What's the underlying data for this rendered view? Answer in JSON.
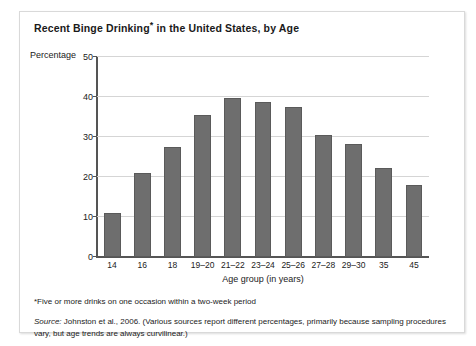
{
  "figure": {
    "title_text": "Recent Binge Drinking",
    "title_asterisk": "*",
    "title_rest": " in the United States, by Age",
    "axis_unit_label": "Percentage",
    "footnote": "*Five or more drinks on one occasion within a two-week period",
    "source_label": "Source:",
    "source_text": " Johnston et al., 2006. (Various sources report different percentages, primarily because sampling procedures vary, but age trends are always curvilinear.)"
  },
  "colors": {
    "bar_fill": "#6e6e6e",
    "bar_edge": "#5a5a5a",
    "gridline": "#d5d5d5",
    "axis": "#555555",
    "frame": "#d9d9d9"
  },
  "chart_data": {
    "type": "bar",
    "title": "Recent Binge Drinking* in the United States, by Age",
    "xlabel": "Age group (in years)",
    "ylabel": "Percentage",
    "categories": [
      "14",
      "16",
      "18",
      "19–20",
      "21–22",
      "23–24",
      "25–26",
      "27–28",
      "29–30",
      "35",
      "45"
    ],
    "values": [
      11,
      21,
      27.5,
      35.5,
      39.7,
      38.8,
      37.5,
      30.5,
      28.3,
      22.2,
      18
    ],
    "ylim": [
      0,
      50
    ],
    "yticks": [
      0,
      10,
      20,
      30,
      40,
      50
    ],
    "ytick_labels": [
      "0",
      "10",
      "20",
      "30",
      "40",
      "50"
    ],
    "grid": true,
    "legend": false
  }
}
